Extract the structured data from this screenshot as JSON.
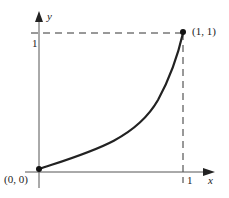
{
  "diagram": {
    "axes": {
      "x_label": "x",
      "y_label": "y",
      "x_tick_label": "1",
      "y_tick_label": "1"
    },
    "points": [
      {
        "label": "(0, 0)",
        "x": 0,
        "y": 0
      },
      {
        "label": "(1, 1)",
        "x": 1,
        "y": 1
      }
    ],
    "curve": {
      "description": "increasing convex curve from (0,0) to (1,1)",
      "color": "#222222"
    },
    "guides": {
      "horizontal_dashed_at_y": 1,
      "vertical_dashed_at_x": 1
    }
  }
}
